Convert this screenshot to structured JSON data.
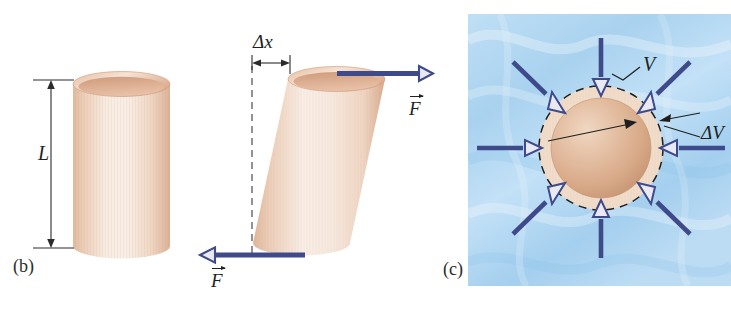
{
  "figure": {
    "background_color": "#ffffff",
    "panels": [
      {
        "id": "b",
        "label": "(b)",
        "title": "Shear deformation of a cylinder",
        "elements": {
          "length_symbol": "L",
          "displacement_symbol": "Δx",
          "force_symbol_top": "F",
          "force_symbol_bottom": "F"
        }
      },
      {
        "id": "c",
        "label": "(c)",
        "title": "Volume deformation of a sphere under uniform pressure",
        "elements": {
          "volume_symbol": "V",
          "volume_change_symbol": "ΔV"
        }
      }
    ]
  },
  "colors": {
    "arrow_blue": "#3f4a8a",
    "arrow_fill": "#e9e9f4",
    "water_blue_light": "#cfe6f7",
    "water_blue_mid": "#a9d3f0",
    "water_blue_dark": "#8cc4ea",
    "material_light": "#f7e6d9",
    "material_mid": "#eed2bd",
    "material_dark": "#d9ab8c",
    "line_dark": "#1f1f1f"
  },
  "panel_b": {
    "label": "(b)",
    "label_x": 13,
    "label_y": 258,
    "length_label": "L",
    "length_label_x": 41,
    "length_label_y": 152,
    "delta_x_label": "Δx",
    "delta_x_label_x": 254,
    "delta_x_label_y": 33,
    "force_top_label": "F",
    "force_top_label_x": 409,
    "force_top_label_y": 92,
    "force_bottom_label": "F",
    "force_bottom_label_x": 212,
    "force_bottom_label_y": 264,
    "dimension_top_y": 80,
    "dimension_bottom_y": 248,
    "dimension_line_x": 51,
    "cylinder_left": 73,
    "cylinder_right": 170,
    "cylinder_top": 72,
    "cylinder_bottom": 258
  },
  "panel_c": {
    "label": "(c)",
    "label_x": 444,
    "label_y": 261,
    "volume_label": "V",
    "volume_label_x": 645,
    "volume_label_y": 57,
    "volume_change_label": "ΔV",
    "volume_change_label_x": 703,
    "volume_change_label_y": 126,
    "panel_left": 468,
    "panel_top": 14,
    "panel_right": 731,
    "panel_bottom": 286,
    "sphere_center_x": 601,
    "sphere_center_y": 148,
    "sphere_radius": 50,
    "dashed_circle_radius": 62,
    "pressure_arrow_count": 8
  }
}
